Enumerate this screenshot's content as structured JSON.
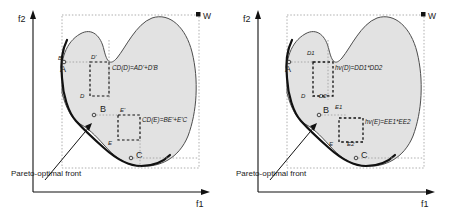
{
  "figure": {
    "type": "diagram",
    "panel_count": 2
  },
  "colors": {
    "region_fill": "#e2e2e2",
    "region_stroke": "#4d4d4d",
    "front_stroke": "#111111",
    "axis": "#111111",
    "dotted": "#999999",
    "dashed_box": "#111111",
    "text": "#1a1a1a"
  },
  "panels": [
    {
      "id": "left",
      "axes": {
        "y_label": "f2",
        "x_label": "f1"
      },
      "reference_point": {
        "label": "W",
        "marker": "filled-square"
      },
      "annotation": {
        "callout_label": "Pareto-optimal front"
      },
      "points": [
        {
          "id": "A",
          "label": "A",
          "marker": "circle"
        },
        {
          "id": "B",
          "label": "B",
          "marker": "circle"
        },
        {
          "id": "C",
          "label": "C",
          "marker": "circle"
        },
        {
          "id": "D",
          "label": "D",
          "marker": "circle"
        },
        {
          "id": "E",
          "label": "E",
          "marker": "circle"
        },
        {
          "id": "Dp",
          "label": "D'",
          "marker": "none"
        },
        {
          "id": "Ep",
          "label": "E'",
          "marker": "none"
        }
      ],
      "formulas": [
        {
          "id": "cd-d",
          "text": "CD(D)=AD'+D'B"
        },
        {
          "id": "cd-e",
          "text": "CD(E)=BE'+E'C"
        }
      ]
    },
    {
      "id": "right",
      "axes": {
        "y_label": "f2",
        "x_label": "f1"
      },
      "reference_point": {
        "label": "W",
        "marker": "filled-square"
      },
      "annotation": {
        "callout_label": "Pareto-optimal front"
      },
      "points": [
        {
          "id": "A",
          "label": "A",
          "marker": "circle"
        },
        {
          "id": "B",
          "label": "B",
          "marker": "circle"
        },
        {
          "id": "C",
          "label": "C",
          "marker": "circle"
        },
        {
          "id": "D",
          "label": "D",
          "marker": "circle"
        },
        {
          "id": "E",
          "label": "E",
          "marker": "circle"
        },
        {
          "id": "D1",
          "label": "D1",
          "marker": "none"
        },
        {
          "id": "D2",
          "label": "D2",
          "marker": "none"
        },
        {
          "id": "E1",
          "label": "E1",
          "marker": "none"
        },
        {
          "id": "E2",
          "label": "E2",
          "marker": "none"
        }
      ],
      "formulas": [
        {
          "id": "hv-d",
          "text": "hv(D)=DD1*DD2"
        },
        {
          "id": "hv-e",
          "text": "hv(E)=EE1*EE2"
        }
      ]
    }
  ]
}
